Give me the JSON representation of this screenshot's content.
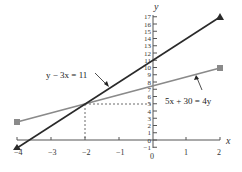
{
  "chart_data": {
    "type": "line",
    "title": "",
    "xlabel": "x",
    "ylabel": "y",
    "xlim": [
      -4,
      2
    ],
    "ylim": [
      -1,
      17
    ],
    "x_ticks": [
      "-4",
      "-3",
      "-2",
      "-1",
      "0",
      "1",
      "2"
    ],
    "y_ticks": [
      "-1",
      "0",
      "1",
      "2",
      "3",
      "4",
      "5",
      "6",
      "7",
      "8",
      "9",
      "10",
      "11",
      "12",
      "13",
      "14",
      "15",
      "16",
      "17"
    ],
    "grid": false,
    "series": [
      {
        "name": "y − 3x = 11",
        "color": "#2a2a2a",
        "marker": "triangle",
        "x": [
          -4,
          2
        ],
        "y": [
          -1,
          17
        ]
      },
      {
        "name": "5x + 30 = 4y",
        "color": "#8a8a8a",
        "marker": "square",
        "x": [
          -4,
          2
        ],
        "y": [
          2.5,
          10
        ]
      }
    ],
    "intersection": {
      "x": -2,
      "y": 5
    },
    "annotations": [
      {
        "text": "y − 3x = 11",
        "target_series": 0
      },
      {
        "text": "5x + 30 = 4y",
        "target_series": 1
      }
    ]
  },
  "labels": {
    "x_axis": "x",
    "y_axis": "y",
    "eq1": "y − 3x = 11",
    "eq2": "5x + 30 = 4y",
    "x_tick_m4": "−4",
    "x_tick_m3": "−3",
    "x_tick_m2": "−2",
    "x_tick_m1": "−1",
    "x_tick_0": "0",
    "x_tick_1": "1",
    "x_tick_2": "2",
    "y_ticks": [
      "−1",
      "0",
      "1",
      "2",
      "3",
      "4",
      "5",
      "6",
      "7",
      "8",
      "9",
      "10",
      "11",
      "12",
      "13",
      "14",
      "15",
      "16",
      "17"
    ]
  }
}
